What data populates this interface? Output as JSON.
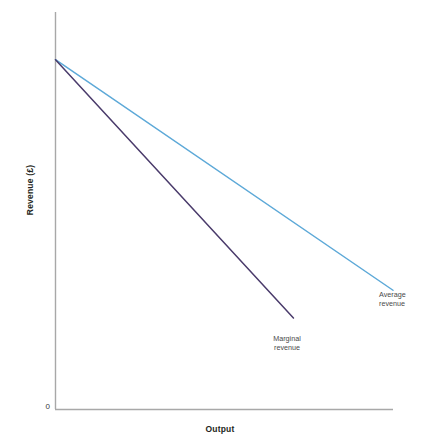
{
  "chart_data": {
    "type": "line",
    "title": "",
    "xlabel": "Output",
    "ylabel": "Revenue (£)",
    "xlim": [
      0,
      100
    ],
    "ylim": [
      0,
      100
    ],
    "grid": false,
    "legend": "inline-annotations",
    "origin_tick": "0",
    "series": [
      {
        "name": "Average revenue",
        "color": "#5da9d8",
        "label_lines": [
          "Average",
          "revenue"
        ],
        "x": [
          0,
          100
        ],
        "y": [
          88,
          30
        ]
      },
      {
        "name": "Marginal revenue",
        "color": "#4a3b6b",
        "label_lines": [
          "Marginal",
          "revenue"
        ],
        "x": [
          0,
          70.5
        ],
        "y": [
          88,
          23
        ]
      }
    ]
  },
  "axes": {
    "y_title": "Revenue (£)",
    "x_title": "Output",
    "origin_label": "0",
    "axis_color": "#a8a8a8"
  },
  "labels": {
    "average_revenue": {
      "line1": "Average",
      "line2": "revenue"
    },
    "marginal_revenue": {
      "line1": "Marginal",
      "line2": "revenue"
    }
  }
}
